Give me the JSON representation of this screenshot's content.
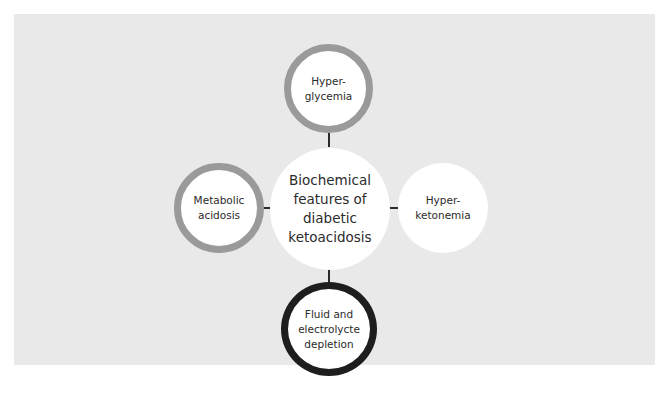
{
  "diagram": {
    "center": {
      "label": "Biochemical\nfeatures of\ndiabetic\nketoacidosis"
    },
    "nodes": [
      {
        "id": "top",
        "label": "Hyper-\nglycemia",
        "ring": "gray",
        "ring_color": "#9a9a9a"
      },
      {
        "id": "left",
        "label": "Metabolic\nacidosis",
        "ring": "gray",
        "ring_color": "#9a9a9a"
      },
      {
        "id": "right",
        "label": "Hyper-\nketonemia",
        "ring": "none"
      },
      {
        "id": "bottom",
        "label": "Fluid and\nelectrolycte\ndepletion",
        "ring": "dark",
        "ring_color": "#1e1e1e"
      }
    ],
    "colors": {
      "background_panel": "#e9e9e9",
      "node_fill": "#ffffff",
      "connector": "#2a2a2a"
    }
  }
}
